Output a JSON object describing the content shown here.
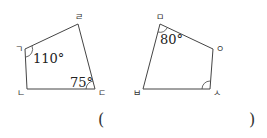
{
  "figure_left": {
    "vertices": {
      "giyeok": "ㄱ",
      "nieun": "ㄴ",
      "digeut": "ㄷ",
      "rieul": "ㄹ"
    },
    "angles": {
      "at_giyeok": "110°",
      "at_digeut": "75°"
    }
  },
  "figure_right": {
    "vertices": {
      "mieum": "ㅁ",
      "bieup": "ㅂ",
      "siot": "ㅅ",
      "ieung": "ㅇ"
    },
    "angles": {
      "at_mieum": "80°"
    }
  },
  "answer": {
    "open": "(",
    "close": ")"
  }
}
